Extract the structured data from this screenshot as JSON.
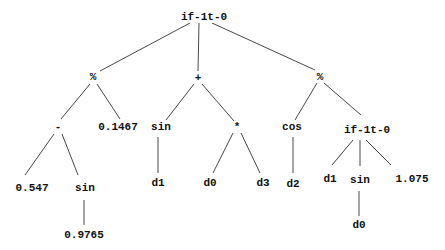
{
  "diagram": {
    "type": "expression-tree",
    "root": "n0",
    "nodes": [
      {
        "id": "n0",
        "label": "if-1t-0",
        "x": 204,
        "y": 17
      },
      {
        "id": "n1",
        "label": "%",
        "x": 93,
        "y": 77
      },
      {
        "id": "n2",
        "label": "+",
        "x": 198,
        "y": 78
      },
      {
        "id": "n3",
        "label": "%",
        "x": 320,
        "y": 77
      },
      {
        "id": "n4",
        "label": "-",
        "x": 58,
        "y": 127
      },
      {
        "id": "n5",
        "label": "0.1467",
        "x": 118,
        "y": 127
      },
      {
        "id": "n6",
        "label": "sin",
        "x": 161,
        "y": 127
      },
      {
        "id": "n7",
        "label": "*",
        "x": 237,
        "y": 127
      },
      {
        "id": "n8",
        "label": "cos",
        "x": 292,
        "y": 127
      },
      {
        "id": "n9",
        "label": "if-1t-0",
        "x": 367,
        "y": 130
      },
      {
        "id": "n10",
        "label": "0.547",
        "x": 32,
        "y": 188
      },
      {
        "id": "n11",
        "label": "sin",
        "x": 85,
        "y": 188
      },
      {
        "id": "n12",
        "label": "d1",
        "x": 158,
        "y": 183
      },
      {
        "id": "n13",
        "label": "d0",
        "x": 210,
        "y": 183
      },
      {
        "id": "n14",
        "label": "d3",
        "x": 263,
        "y": 183
      },
      {
        "id": "n15",
        "label": "d2",
        "x": 293,
        "y": 184
      },
      {
        "id": "n16",
        "label": "d1",
        "x": 330,
        "y": 179
      },
      {
        "id": "n17",
        "label": "sin",
        "x": 360,
        "y": 180
      },
      {
        "id": "n18",
        "label": "1.075",
        "x": 412,
        "y": 179
      },
      {
        "id": "n19",
        "label": "0.9765",
        "x": 84,
        "y": 235
      },
      {
        "id": "n20",
        "label": "d0",
        "x": 359,
        "y": 225
      }
    ],
    "edges": [
      {
        "from": "n0",
        "to": "n1",
        "x1": 190,
        "y1": 23,
        "x2": 100,
        "y2": 71
      },
      {
        "from": "n0",
        "to": "n2",
        "x1": 199,
        "y1": 23,
        "x2": 198,
        "y2": 71
      },
      {
        "from": "n0",
        "to": "n3",
        "x1": 212,
        "y1": 23,
        "x2": 315,
        "y2": 70
      },
      {
        "from": "n1",
        "to": "n4",
        "x1": 90,
        "y1": 84,
        "x2": 61,
        "y2": 119
      },
      {
        "from": "n1",
        "to": "n5",
        "x1": 97,
        "y1": 84,
        "x2": 120,
        "y2": 119
      },
      {
        "from": "n2",
        "to": "n6",
        "x1": 194,
        "y1": 84,
        "x2": 166,
        "y2": 120
      },
      {
        "from": "n2",
        "to": "n7",
        "x1": 202,
        "y1": 84,
        "x2": 234,
        "y2": 121
      },
      {
        "from": "n3",
        "to": "n8",
        "x1": 317,
        "y1": 83,
        "x2": 295,
        "y2": 120
      },
      {
        "from": "n3",
        "to": "n9",
        "x1": 324,
        "y1": 83,
        "x2": 361,
        "y2": 115
      },
      {
        "from": "n4",
        "to": "n10",
        "x1": 54,
        "y1": 134,
        "x2": 25,
        "y2": 175
      },
      {
        "from": "n4",
        "to": "n11",
        "x1": 62,
        "y1": 134,
        "x2": 78,
        "y2": 175
      },
      {
        "from": "n11",
        "to": "n19",
        "x1": 84,
        "y1": 200,
        "x2": 84,
        "y2": 225
      },
      {
        "from": "n6",
        "to": "n12",
        "x1": 158,
        "y1": 137,
        "x2": 158,
        "y2": 173
      },
      {
        "from": "n7",
        "to": "n13",
        "x1": 233,
        "y1": 133,
        "x2": 213,
        "y2": 173
      },
      {
        "from": "n7",
        "to": "n14",
        "x1": 241,
        "y1": 133,
        "x2": 260,
        "y2": 173
      },
      {
        "from": "n8",
        "to": "n15",
        "x1": 293,
        "y1": 137,
        "x2": 293,
        "y2": 173
      },
      {
        "from": "n9",
        "to": "n16",
        "x1": 353,
        "y1": 140,
        "x2": 332,
        "y2": 165
      },
      {
        "from": "n9",
        "to": "n17",
        "x1": 360,
        "y1": 140,
        "x2": 360,
        "y2": 166
      },
      {
        "from": "n9",
        "to": "n18",
        "x1": 366,
        "y1": 140,
        "x2": 391,
        "y2": 165
      },
      {
        "from": "n17",
        "to": "n20",
        "x1": 359,
        "y1": 191,
        "x2": 359,
        "y2": 216
      }
    ]
  }
}
